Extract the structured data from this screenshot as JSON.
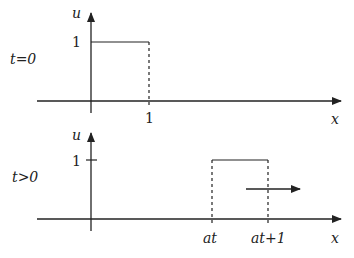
{
  "diagram": {
    "colors": {
      "line": "#222222",
      "background": "#ffffff"
    },
    "panels": [
      {
        "id": "top",
        "time_label": "t=0",
        "y_axis_label": "u",
        "x_axis_label": "x",
        "y_tick_label": "1",
        "x_tick_labels": [
          "1"
        ],
        "pulse": {
          "from": "0",
          "to": "1",
          "height": "1"
        }
      },
      {
        "id": "bottom",
        "time_label": "t>0",
        "y_axis_label": "u",
        "x_axis_label": "x",
        "y_tick_label": "1",
        "x_tick_labels": [
          "at",
          "at+1"
        ],
        "pulse": {
          "from": "at",
          "to": "at+1",
          "height": "1"
        },
        "motion_arrow": "right"
      }
    ]
  }
}
